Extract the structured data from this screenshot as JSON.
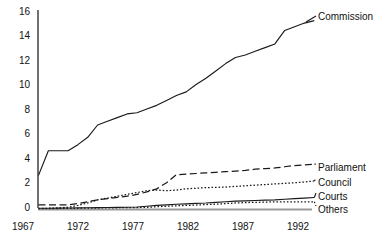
{
  "chart_data": {
    "type": "line",
    "title": "",
    "subtitle": "",
    "xlabel": "",
    "ylabel": "",
    "xlim": [
      1967,
      1995
    ],
    "ylim": [
      0,
      16
    ],
    "grid": false,
    "legend_position": "right-inline-labels",
    "xticks": [
      "1967",
      "1972",
      "1977",
      "1982",
      "1987",
      "1992"
    ],
    "xtick_values": [
      1967,
      1972,
      1977,
      1982,
      1987,
      1992
    ],
    "yticks": [
      "0",
      "2",
      "4",
      "6",
      "8",
      "10",
      "12",
      "14",
      "16"
    ],
    "ytick_values": [
      0,
      2,
      4,
      6,
      8,
      10,
      12,
      14,
      16
    ],
    "x": [
      1967,
      1968,
      1969,
      1970,
      1971,
      1972,
      1973,
      1974,
      1975,
      1976,
      1977,
      1978,
      1979,
      1980,
      1981,
      1982,
      1983,
      1984,
      1985,
      1986,
      1987,
      1988,
      1989,
      1990,
      1991,
      1992,
      1993,
      1994,
      1995
    ],
    "series": [
      {
        "name": "Commission",
        "label": "Commission",
        "linestyle": "solid",
        "color": "#1a1a1a",
        "values": [
          2.7,
          4.7,
          4.7,
          4.7,
          5.2,
          5.8,
          6.8,
          7.1,
          7.4,
          7.7,
          7.8,
          8.1,
          8.4,
          8.8,
          9.2,
          9.5,
          10.1,
          10.6,
          11.2,
          11.8,
          12.3,
          12.5,
          12.8,
          13.1,
          13.4,
          14.5,
          14.8,
          15.1,
          15.3
        ]
      },
      {
        "name": "Parliament",
        "label": "Parliament",
        "linestyle": "dashed",
        "color": "#1a1a1a",
        "values": [
          0.3,
          0.3,
          0.3,
          0.3,
          0.4,
          0.55,
          0.7,
          0.8,
          0.9,
          1.0,
          1.15,
          1.35,
          1.6,
          2.1,
          2.75,
          2.8,
          2.85,
          2.9,
          2.95,
          3.0,
          3.05,
          3.1,
          3.2,
          3.25,
          3.3,
          3.4,
          3.5,
          3.55,
          3.6
        ]
      },
      {
        "name": "Council",
        "label": "Council",
        "linestyle": "dotted",
        "color": "#1a1a1a",
        "values": [
          0.0,
          0.02,
          0.05,
          0.1,
          0.25,
          0.45,
          0.7,
          0.85,
          1.0,
          1.15,
          1.3,
          1.45,
          1.5,
          1.45,
          1.5,
          1.6,
          1.65,
          1.7,
          1.72,
          1.75,
          1.8,
          1.85,
          1.9,
          1.95,
          2.0,
          2.05,
          2.1,
          2.15,
          2.25
        ]
      },
      {
        "name": "Courts",
        "label": "Courts",
        "linestyle": "solid",
        "color": "#1a1a1a",
        "values": [
          0.02,
          0.02,
          0.03,
          0.04,
          0.05,
          0.06,
          0.07,
          0.08,
          0.09,
          0.1,
          0.12,
          0.18,
          0.25,
          0.3,
          0.35,
          0.38,
          0.42,
          0.45,
          0.5,
          0.55,
          0.6,
          0.62,
          0.65,
          0.68,
          0.7,
          0.75,
          0.8,
          0.85,
          0.9
        ]
      },
      {
        "name": "Others",
        "label": "Others",
        "linestyle": "dotted",
        "color": "#1a1a1a",
        "values": [
          0.0,
          0.0,
          0.0,
          0.01,
          0.02,
          0.03,
          0.04,
          0.05,
          0.06,
          0.07,
          0.08,
          0.1,
          0.14,
          0.18,
          0.22,
          0.25,
          0.28,
          0.32,
          0.35,
          0.4,
          0.45,
          0.48,
          0.5,
          0.52,
          0.55,
          0.55,
          0.55,
          0.55,
          0.55
        ]
      }
    ]
  },
  "axis": {
    "axis_color": "#111111",
    "baseline_color": "#808080"
  }
}
